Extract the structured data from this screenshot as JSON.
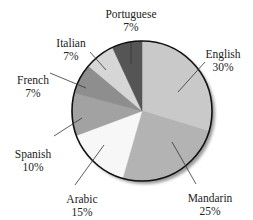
{
  "chart_data": {
    "type": "pie",
    "title": "",
    "start_angle_deg": 0,
    "direction": "clockwise",
    "center": [
      142,
      111
    ],
    "radius": 70,
    "slices": [
      {
        "label": "English",
        "value": 30,
        "display": "30%",
        "color": "#c9c9c9",
        "label_pos": [
          223,
          48
        ],
        "leader": [
          [
            205,
            62
          ],
          [
            178,
            92
          ]
        ]
      },
      {
        "label": "Mandarin",
        "value": 25,
        "display": "25%",
        "color": "#b3b3b3",
        "label_pos": [
          210,
          192
        ],
        "leader": [
          [
            196,
            184
          ],
          [
            172,
            142
          ]
        ]
      },
      {
        "label": "Arabic",
        "value": 15,
        "display": "15%",
        "color": "#f7f7f7",
        "label_pos": [
          82,
          193
        ],
        "leader": [
          [
            75,
            185
          ],
          [
            104,
            145
          ]
        ]
      },
      {
        "label": "Spanish",
        "value": 10,
        "display": "10%",
        "color": "#a2a2a2",
        "label_pos": [
          33,
          148
        ],
        "leader": [
          [
            54,
            136
          ],
          [
            82,
            118
          ]
        ]
      },
      {
        "label": "French",
        "value": 7,
        "display": "7%",
        "color": "#8e8e8e",
        "label_pos": [
          33,
          74
        ],
        "leader": [
          [
            50,
            73
          ],
          [
            86,
            88
          ]
        ]
      },
      {
        "label": "Italian",
        "value": 7,
        "display": "7%",
        "color": "#d6d6d6",
        "label_pos": [
          71,
          37
        ],
        "leader": [
          [
            90,
            52
          ],
          [
            106,
            70
          ]
        ]
      },
      {
        "label": "Portuguese",
        "value": 7,
        "display": "7%",
        "color": "#555555",
        "label_pos": [
          131,
          8
        ],
        "leader": [
          [
            131,
            42
          ],
          [
            131,
            64
          ]
        ]
      }
    ],
    "legend": null,
    "note": "Labels as displayed sum to 101%"
  }
}
